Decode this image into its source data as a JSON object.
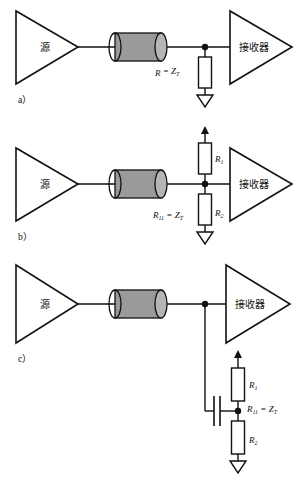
{
  "figure": {
    "title_caption": "",
    "background_color": "#ffffff",
    "line_color": "#111111",
    "cable_fill_color": "#9a9a9a",
    "cable_cap_color": "#b5b5b5",
    "resistor_fill_color": "#ffffff"
  },
  "labels": {
    "source": "源",
    "receiver": "接收器"
  },
  "panels": [
    {
      "id": "a",
      "id_label": "a）",
      "scheme": "parallel-termination",
      "source_label": "源",
      "receiver_label": "接收器",
      "resistors": [
        {
          "name": "R",
          "label_main": "R",
          "label_sub": "",
          "equation": "R = Z",
          "equation_sub": "T"
        }
      ],
      "termination_text_main": "R",
      "termination_text_sub": "",
      "termination_eq_prefix": " = Z",
      "termination_eq_sub": "T",
      "has_capacitor": false,
      "has_supply_arrow": false,
      "has_ground": true
    },
    {
      "id": "b",
      "id_label": "b）",
      "scheme": "thevenin-split-termination",
      "source_label": "源",
      "receiver_label": "接收器",
      "resistors": [
        {
          "name": "R1",
          "label_main": "R",
          "label_sub": "1"
        },
        {
          "name": "R2",
          "label_main": "R",
          "label_sub": "2"
        }
      ],
      "termination_text_main": "R",
      "termination_text_sub": "11",
      "termination_eq_prefix": " = Z",
      "termination_eq_sub": "T",
      "has_capacitor": false,
      "has_supply_arrow": true,
      "has_ground": true
    },
    {
      "id": "c",
      "id_label": "c）",
      "scheme": "ac-capacitive-coupled-termination",
      "source_label": "源",
      "receiver_label": "接收器",
      "resistors": [
        {
          "name": "R1",
          "label_main": "R",
          "label_sub": "1"
        },
        {
          "name": "R2",
          "label_main": "R",
          "label_sub": "2"
        }
      ],
      "termination_text_main": "R",
      "termination_text_sub": "11",
      "termination_eq_prefix": " = Z",
      "termination_eq_sub": "T",
      "has_capacitor": true,
      "has_supply_arrow": true,
      "has_ground": true
    }
  ]
}
